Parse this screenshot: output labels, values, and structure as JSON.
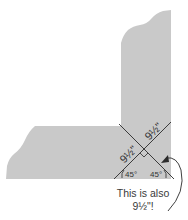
{
  "diagram": {
    "title": "",
    "colors": {
      "board_fill": "#c9c9c9",
      "line": "#2a2a2a",
      "text": "#333333"
    },
    "labels": {
      "upper_segment": "9½\"",
      "left_segment": "9½\"",
      "angle_left": "45°",
      "angle_right": "45°"
    },
    "caption": {
      "line1": "This is also",
      "line2": "9½\"!"
    },
    "annotations": {
      "right_angle_marker": "right-angle",
      "arrow": "curved arrow pointing to bottom-right diagonal segment"
    }
  }
}
